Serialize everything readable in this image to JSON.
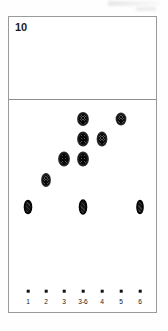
{
  "figure": {
    "number": "10",
    "type": "thin-layer-chromatography-plate"
  },
  "lanes": [
    {
      "label": "1",
      "x": 27
    },
    {
      "label": "2",
      "x": 45
    },
    {
      "label": "3",
      "x": 63
    },
    {
      "label": "3-6",
      "x": 82
    },
    {
      "label": "4",
      "x": 101
    },
    {
      "label": "5",
      "x": 120
    },
    {
      "label": "6",
      "x": 139
    }
  ],
  "chart_data": {
    "type": "scatter",
    "title": "10",
    "xlabel": "",
    "ylabel": "",
    "categories": [
      "1",
      "2",
      "3",
      "3-6",
      "4",
      "5",
      "6"
    ],
    "spots": [
      {
        "lane": "1",
        "x": 27,
        "y": 205,
        "w": 7,
        "h": 13,
        "style": "solid"
      },
      {
        "lane": "2",
        "x": 45,
        "y": 178,
        "w": 8,
        "h": 12,
        "style": "hatched"
      },
      {
        "lane": "3",
        "x": 63,
        "y": 157,
        "w": 10,
        "h": 13,
        "style": "hatched"
      },
      {
        "lane": "3-6",
        "x": 82,
        "y": 205,
        "w": 7,
        "h": 14,
        "style": "solid"
      },
      {
        "lane": "3-6",
        "x": 82,
        "y": 157,
        "w": 10,
        "h": 13,
        "style": "hatched"
      },
      {
        "lane": "3-6",
        "x": 82,
        "y": 137,
        "w": 10,
        "h": 13,
        "style": "hatched"
      },
      {
        "lane": "3-6",
        "x": 82,
        "y": 117,
        "w": 10,
        "h": 12,
        "style": "hatched"
      },
      {
        "lane": "4",
        "x": 101,
        "y": 137,
        "w": 9,
        "h": 13,
        "style": "hatched"
      },
      {
        "lane": "5",
        "x": 120,
        "y": 117,
        "w": 9,
        "h": 11,
        "style": "hatched"
      },
      {
        "lane": "6",
        "x": 139,
        "y": 205,
        "w": 6,
        "h": 13,
        "style": "solid"
      }
    ],
    "origin_dots_y": 289,
    "lane_label_y": 297,
    "solvent_front_y": 98
  }
}
